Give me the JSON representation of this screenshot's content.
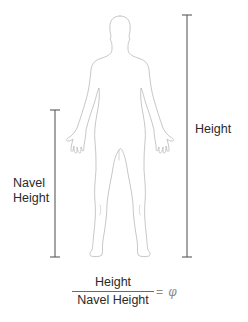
{
  "diagram": {
    "labels": {
      "height": "Height",
      "navel_line1": "Navel",
      "navel_line2": "Height"
    },
    "formula": {
      "numerator": "Height",
      "denominator": "Navel Height",
      "equals": "=",
      "symbol": "φ"
    },
    "measures": [
      {
        "name": "height",
        "x": 187,
        "y_top": 15,
        "y_bottom": 257
      },
      {
        "name": "navel-height",
        "x": 55,
        "y_top": 110,
        "y_bottom": 257
      }
    ],
    "colors": {
      "line": "#5a5a5a",
      "outline": "#b9b9b9",
      "text": "#2b2b2b",
      "equals": "#8a8a8a"
    }
  }
}
